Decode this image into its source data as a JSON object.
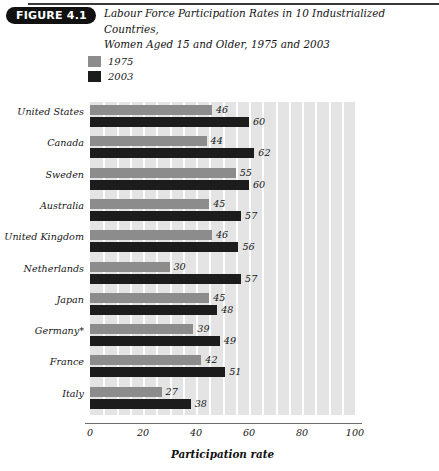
{
  "header": {
    "badge": "FIGURE 4.1",
    "title_line1": "Labour Force Participation Rates in 10 Industrialized Countries,",
    "title_line2": "Women Aged 15 and Older, 1975 and 2003"
  },
  "legend": {
    "items": [
      {
        "label": "1975",
        "color": "#8c8c8c"
      },
      {
        "label": "2003",
        "color": "#1c1c1c"
      }
    ]
  },
  "chart_data": {
    "type": "bar",
    "orientation": "horizontal",
    "title": "Labour Force Participation Rates in 10 Industrialized Countries, Women Aged 15 and Older, 1975 and 2003",
    "xlabel": "Participation rate",
    "ylabel": "",
    "xlim": [
      0,
      100
    ],
    "xticks": [
      0,
      20,
      40,
      60,
      80,
      100
    ],
    "grid": true,
    "grid_step": 5,
    "legend_position": "top-left",
    "categories": [
      "United States",
      "Canada",
      "Sweden",
      "Australia",
      "United Kingdom",
      "Netherlands",
      "Japan",
      "Germany*",
      "France",
      "Italy"
    ],
    "series": [
      {
        "name": "1975",
        "color": "#8c8c8c",
        "values": [
          46,
          44,
          55,
          45,
          46,
          30,
          45,
          39,
          42,
          27
        ]
      },
      {
        "name": "2003",
        "color": "#1c1c1c",
        "values": [
          60,
          62,
          60,
          57,
          56,
          57,
          48,
          49,
          51,
          38
        ]
      }
    ]
  }
}
